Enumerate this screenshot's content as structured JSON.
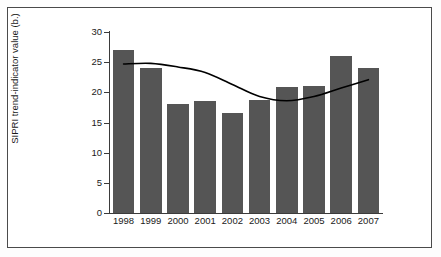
{
  "chart_data": {
    "type": "bar",
    "title": "",
    "xlabel": "",
    "ylabel": "SIPRI trend-indicator value (b.)",
    "categories": [
      "1998",
      "1999",
      "2000",
      "2001",
      "2002",
      "2003",
      "2004",
      "2005",
      "2006",
      "2007"
    ],
    "values": [
      27.0,
      24.0,
      18.1,
      18.5,
      16.6,
      18.7,
      20.9,
      21.0,
      26.0,
      24.0
    ],
    "ylim": [
      0,
      30
    ],
    "yticks": [
      0,
      5,
      10,
      15,
      20,
      25,
      30
    ],
    "ytick_labels": [
      "0",
      "5",
      "10",
      "15",
      "20",
      "25",
      "30"
    ],
    "grid": false,
    "legend": "none",
    "series": [
      {
        "name": "SIPRI trend-indicator value (b.)",
        "type": "bar",
        "color": "#555555",
        "values": [
          27.0,
          24.0,
          18.1,
          18.5,
          16.6,
          18.7,
          20.9,
          21.0,
          26.0,
          24.0
        ]
      },
      {
        "name": "trend line",
        "type": "line",
        "color": "#000000",
        "values": [
          24.7,
          24.8,
          24.2,
          23.3,
          21.3,
          19.3,
          18.6,
          19.3,
          20.7,
          22.1
        ]
      }
    ]
  },
  "axes": {
    "ylabel": "SIPRI trend-indicator value (b.)",
    "ytick_labels": [
      "30",
      "25",
      "20",
      "15",
      "10",
      "5",
      "0"
    ],
    "xtick_labels": [
      "1998",
      "1999",
      "2000",
      "2001",
      "2002",
      "2003",
      "2004",
      "2005",
      "2006",
      "2007"
    ]
  },
  "colors": {
    "bar_fill": "#555555",
    "trend_line": "#000000",
    "axis": "#3b3b3b",
    "frame": "#4a4a4a",
    "background": "#ffffff"
  }
}
